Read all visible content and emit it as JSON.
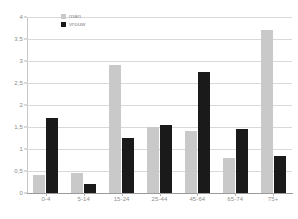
{
  "chart_data": {
    "type": "bar",
    "title": "",
    "xlabel": "",
    "ylabel": "",
    "ylim": [
      0,
      4
    ],
    "ytick_labels": [
      "4",
      "3,5",
      "3",
      "2,5",
      "2",
      "1,5",
      "1",
      "0,5",
      "0"
    ],
    "ytick_values": [
      4,
      3.5,
      3,
      2.5,
      2,
      1.5,
      1,
      0.5,
      0
    ],
    "grid": true,
    "legend_position": "top-left-inside",
    "categories": [
      "0-4",
      "5-14",
      "15-24",
      "25-44",
      "45-64",
      "65-74",
      "75+"
    ],
    "series": [
      {
        "name": "man",
        "color": "#c9c9c9",
        "values": [
          0.4,
          0.45,
          2.9,
          1.5,
          1.4,
          0.8,
          3.7
        ]
      },
      {
        "name": "vrouw",
        "color": "#1a1a1a",
        "values": [
          1.7,
          0.2,
          1.25,
          1.55,
          2.75,
          1.45,
          0.85
        ]
      }
    ]
  },
  "legend": {
    "items": [
      {
        "label": "man",
        "swatch": "man"
      },
      {
        "label": "vrouw",
        "swatch": "vrouw"
      }
    ]
  }
}
